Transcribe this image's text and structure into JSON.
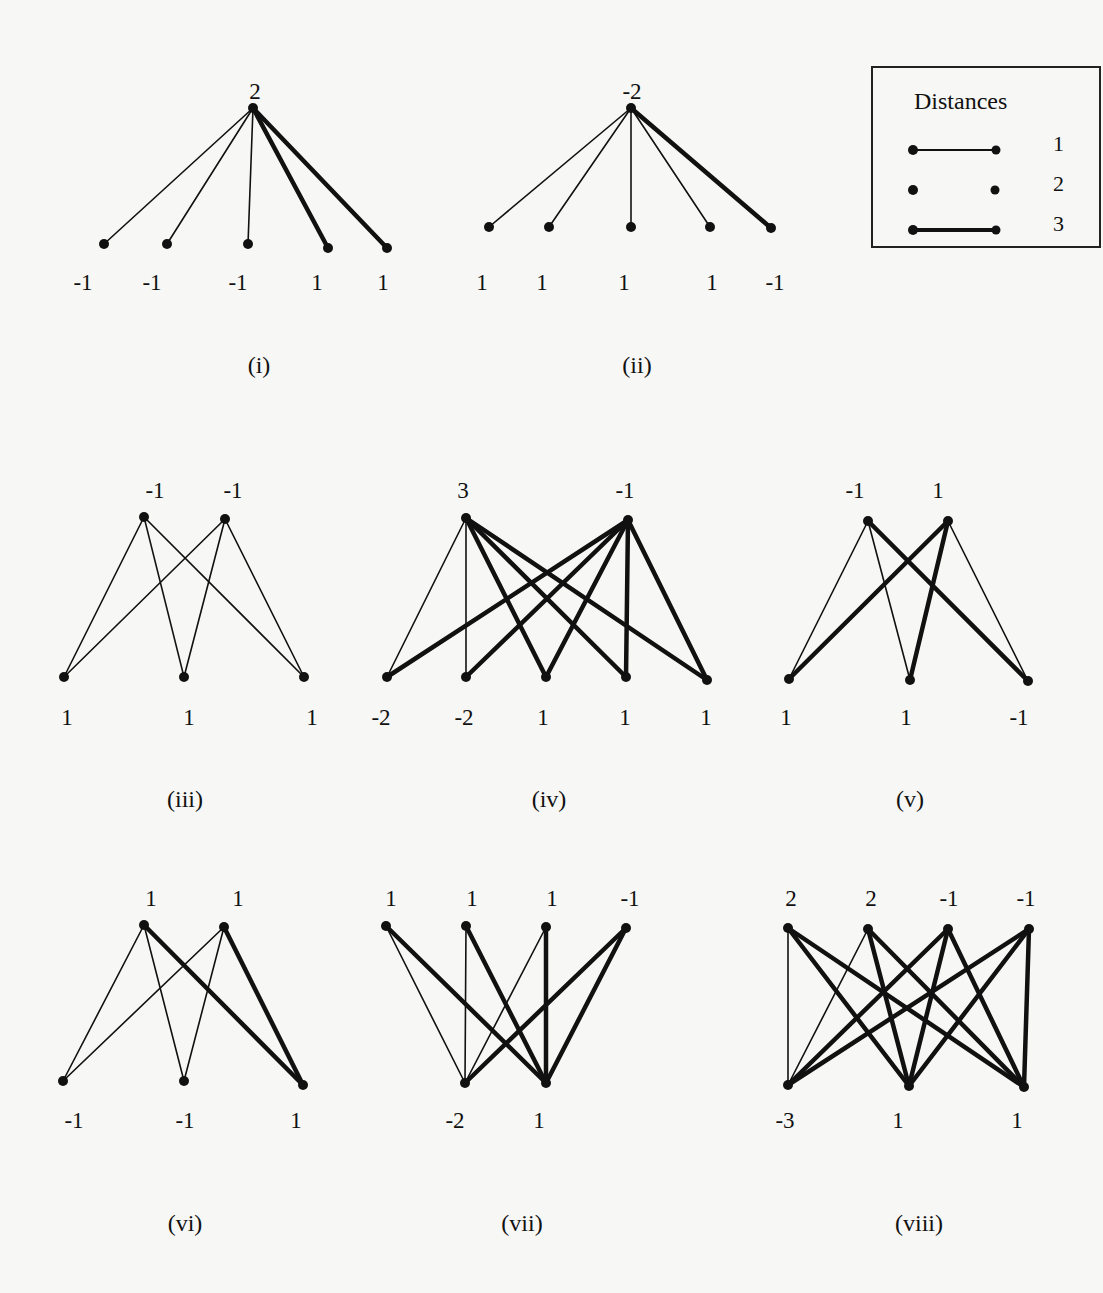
{
  "legend": {
    "title": "Distances",
    "entries": [
      {
        "label": "1",
        "style": "thin"
      },
      {
        "label": "2",
        "style": "none"
      },
      {
        "label": "3",
        "style": "thick"
      }
    ]
  },
  "stroke_widths": {
    "1": 1.6,
    "3": 4.5
  },
  "colors": {
    "ink": "#111111",
    "paper": "#f7f7f5"
  },
  "figures": [
    {
      "id": "i",
      "caption": "(i)",
      "caption_pos": [
        259,
        372
      ],
      "nodes": [
        {
          "x": 253,
          "y": 108,
          "label": "2",
          "lx": 255,
          "ly": 99
        },
        {
          "x": 104,
          "y": 244,
          "label": "-1",
          "lx": 83,
          "ly": 290
        },
        {
          "x": 167,
          "y": 244,
          "label": "-1",
          "lx": 152,
          "ly": 290
        },
        {
          "x": 248,
          "y": 244,
          "label": "-1",
          "lx": 238,
          "ly": 290
        },
        {
          "x": 328,
          "y": 248,
          "label": "1",
          "lx": 317,
          "ly": 290
        },
        {
          "x": 387,
          "y": 248,
          "label": "1",
          "lx": 383,
          "ly": 290
        }
      ],
      "edges": [
        [
          0,
          1,
          1
        ],
        [
          0,
          2,
          1
        ],
        [
          0,
          3,
          1
        ],
        [
          0,
          4,
          3
        ],
        [
          0,
          5,
          3
        ]
      ]
    },
    {
      "id": "ii",
      "caption": "(ii)",
      "caption_pos": [
        637,
        372
      ],
      "nodes": [
        {
          "x": 631,
          "y": 108,
          "label": "-2",
          "lx": 632,
          "ly": 99
        },
        {
          "x": 489,
          "y": 227,
          "label": "1",
          "lx": 482,
          "ly": 290
        },
        {
          "x": 549,
          "y": 227,
          "label": "1",
          "lx": 542,
          "ly": 290
        },
        {
          "x": 631,
          "y": 227,
          "label": "1",
          "lx": 624,
          "ly": 290
        },
        {
          "x": 710,
          "y": 227,
          "label": "1",
          "lx": 712,
          "ly": 290
        },
        {
          "x": 771,
          "y": 228,
          "label": "-1",
          "lx": 775,
          "ly": 290
        }
      ],
      "edges": [
        [
          0,
          1,
          1
        ],
        [
          0,
          2,
          1
        ],
        [
          0,
          3,
          1
        ],
        [
          0,
          4,
          1
        ],
        [
          0,
          5,
          3
        ]
      ]
    },
    {
      "id": "iii",
      "caption": "(iii)",
      "caption_pos": [
        185,
        806
      ],
      "nodes": [
        {
          "x": 144,
          "y": 517,
          "label": "-1",
          "lx": 155,
          "ly": 498
        },
        {
          "x": 225,
          "y": 519,
          "label": "-1",
          "lx": 233,
          "ly": 498
        },
        {
          "x": 64,
          "y": 677,
          "label": "1",
          "lx": 67,
          "ly": 725
        },
        {
          "x": 184,
          "y": 677,
          "label": "1",
          "lx": 189,
          "ly": 725
        },
        {
          "x": 304,
          "y": 677,
          "label": "1",
          "lx": 312,
          "ly": 725
        }
      ],
      "edges": [
        [
          0,
          2,
          1
        ],
        [
          0,
          3,
          1
        ],
        [
          0,
          4,
          1
        ],
        [
          1,
          2,
          1
        ],
        [
          1,
          3,
          1
        ],
        [
          1,
          4,
          1
        ]
      ]
    },
    {
      "id": "iv",
      "caption": "(iv)",
      "caption_pos": [
        549,
        806
      ],
      "nodes": [
        {
          "x": 466,
          "y": 518,
          "label": "3",
          "lx": 463,
          "ly": 498
        },
        {
          "x": 628,
          "y": 520,
          "label": "-1",
          "lx": 625,
          "ly": 498
        },
        {
          "x": 387,
          "y": 677,
          "label": "-2",
          "lx": 381,
          "ly": 725
        },
        {
          "x": 466,
          "y": 677,
          "label": "-2",
          "lx": 464,
          "ly": 725
        },
        {
          "x": 546,
          "y": 677,
          "label": "1",
          "lx": 543,
          "ly": 725
        },
        {
          "x": 626,
          "y": 677,
          "label": "1",
          "lx": 625,
          "ly": 725
        },
        {
          "x": 707,
          "y": 680,
          "label": "1",
          "lx": 706,
          "ly": 725
        }
      ],
      "edges": [
        [
          0,
          2,
          1
        ],
        [
          0,
          3,
          1
        ],
        [
          0,
          4,
          3
        ],
        [
          0,
          5,
          3
        ],
        [
          0,
          6,
          3
        ],
        [
          1,
          2,
          3
        ],
        [
          1,
          3,
          3
        ],
        [
          1,
          4,
          3
        ],
        [
          1,
          5,
          3
        ],
        [
          1,
          6,
          3
        ]
      ]
    },
    {
      "id": "v",
      "caption": "(v)",
      "caption_pos": [
        910,
        806
      ],
      "nodes": [
        {
          "x": 868,
          "y": 521,
          "label": "-1",
          "lx": 855,
          "ly": 498
        },
        {
          "x": 948,
          "y": 521,
          "label": "1",
          "lx": 938,
          "ly": 498
        },
        {
          "x": 789,
          "y": 679,
          "label": "1",
          "lx": 786,
          "ly": 725
        },
        {
          "x": 910,
          "y": 680,
          "label": "1",
          "lx": 906,
          "ly": 725
        },
        {
          "x": 1028,
          "y": 681,
          "label": "-1",
          "lx": 1019,
          "ly": 725
        }
      ],
      "edges": [
        [
          0,
          2,
          1
        ],
        [
          0,
          3,
          1
        ],
        [
          0,
          4,
          3
        ],
        [
          1,
          2,
          3
        ],
        [
          1,
          3,
          3
        ],
        [
          1,
          4,
          1
        ]
      ]
    },
    {
      "id": "vi",
      "caption": "(vi)",
      "caption_pos": [
        185,
        1230
      ],
      "nodes": [
        {
          "x": 144,
          "y": 925,
          "label": "1",
          "lx": 151,
          "ly": 906
        },
        {
          "x": 224,
          "y": 927,
          "label": "1",
          "lx": 238,
          "ly": 906
        },
        {
          "x": 63,
          "y": 1081,
          "label": "-1",
          "lx": 74,
          "ly": 1128
        },
        {
          "x": 184,
          "y": 1081,
          "label": "-1",
          "lx": 185,
          "ly": 1128
        },
        {
          "x": 303,
          "y": 1085,
          "label": "1",
          "lx": 296,
          "ly": 1128
        }
      ],
      "edges": [
        [
          0,
          2,
          1
        ],
        [
          0,
          3,
          1
        ],
        [
          0,
          4,
          3
        ],
        [
          1,
          2,
          1
        ],
        [
          1,
          3,
          1
        ],
        [
          1,
          4,
          3
        ]
      ]
    },
    {
      "id": "vii",
      "caption": "(vii)",
      "caption_pos": [
        522,
        1230
      ],
      "nodes": [
        {
          "x": 386,
          "y": 926,
          "label": "1",
          "lx": 391,
          "ly": 906
        },
        {
          "x": 466,
          "y": 926,
          "label": "1",
          "lx": 472,
          "ly": 906
        },
        {
          "x": 546,
          "y": 927,
          "label": "1",
          "lx": 552,
          "ly": 906
        },
        {
          "x": 626,
          "y": 928,
          "label": "-1",
          "lx": 630,
          "ly": 906
        },
        {
          "x": 465,
          "y": 1083,
          "label": "-2",
          "lx": 455,
          "ly": 1128
        },
        {
          "x": 546,
          "y": 1083,
          "label": "1",
          "lx": 539,
          "ly": 1128
        }
      ],
      "edges": [
        [
          0,
          4,
          1
        ],
        [
          0,
          5,
          3
        ],
        [
          1,
          4,
          1
        ],
        [
          1,
          5,
          3
        ],
        [
          2,
          4,
          1
        ],
        [
          2,
          5,
          3
        ],
        [
          3,
          4,
          3
        ],
        [
          3,
          5,
          3
        ]
      ]
    },
    {
      "id": "viii",
      "caption": "(viii)",
      "caption_pos": [
        919,
        1230
      ],
      "nodes": [
        {
          "x": 788,
          "y": 928,
          "label": "2",
          "lx": 791,
          "ly": 906
        },
        {
          "x": 868,
          "y": 929,
          "label": "2",
          "lx": 871,
          "ly": 906
        },
        {
          "x": 948,
          "y": 929,
          "label": "-1",
          "lx": 949,
          "ly": 906
        },
        {
          "x": 1029,
          "y": 929,
          "label": "-1",
          "lx": 1026,
          "ly": 906
        },
        {
          "x": 788,
          "y": 1085,
          "label": "-3",
          "lx": 785,
          "ly": 1128
        },
        {
          "x": 909,
          "y": 1086,
          "label": "1",
          "lx": 898,
          "ly": 1128
        },
        {
          "x": 1024,
          "y": 1087,
          "label": "1",
          "lx": 1017,
          "ly": 1128
        }
      ],
      "edges": [
        [
          0,
          4,
          1
        ],
        [
          0,
          5,
          3
        ],
        [
          0,
          6,
          3
        ],
        [
          1,
          4,
          1
        ],
        [
          1,
          5,
          3
        ],
        [
          1,
          6,
          3
        ],
        [
          2,
          4,
          3
        ],
        [
          2,
          5,
          3
        ],
        [
          2,
          6,
          3
        ],
        [
          3,
          4,
          3
        ],
        [
          3,
          5,
          3
        ],
        [
          3,
          6,
          3
        ]
      ]
    }
  ]
}
